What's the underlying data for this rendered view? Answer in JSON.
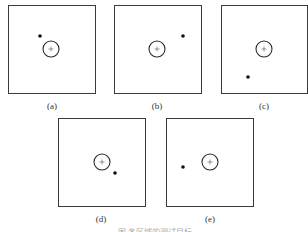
{
  "figure": {
    "panels": [
      {
        "id": "a",
        "label": "(a)",
        "target_offset": "upper-left"
      },
      {
        "id": "b",
        "label": "(b)",
        "target_offset": "upper-right"
      },
      {
        "id": "c",
        "label": "(c)",
        "target_offset": "lower-left"
      },
      {
        "id": "d",
        "label": "(d)",
        "target_offset": "lower-right-near"
      },
      {
        "id": "e",
        "label": "(e)",
        "target_offset": "left"
      }
    ],
    "caption": "图 各区域的测试目标"
  }
}
